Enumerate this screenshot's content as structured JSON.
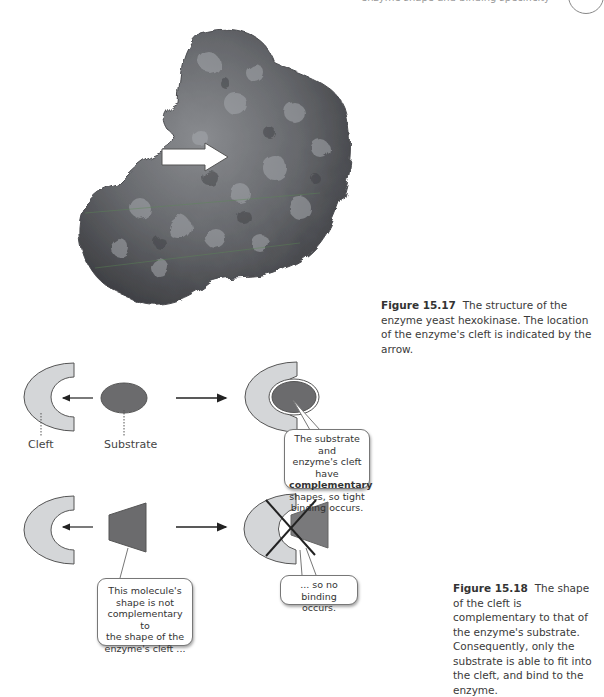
{
  "header": {
    "running_text": "enzyme shape and binding specificity"
  },
  "figure_15_17": {
    "label": "Figure 15.17",
    "caption": "The structure of the enzyme yeast hexokinase. The location of the enzyme's cleft is indicated by the arrow.",
    "image": "protein-surface-hexokinase",
    "arrow": "cleft-arrow"
  },
  "figure_15_18": {
    "label": "Figure 15.18",
    "caption": "The shape of the cleft is complementary to that of the enzyme's substrate. Consequently, only the substrate is able to fit into the cleft, and bind to the enzyme.",
    "labels": {
      "cleft": "Cleft",
      "substrate": "Substrate"
    },
    "bubble_bind": {
      "line1": "The substrate and",
      "line2": "enzyme's cleft have",
      "bold": "complementary",
      "line4": "shapes, so tight",
      "line5": "binding occurs."
    },
    "bubble_not": {
      "line1": "This molecule's",
      "line2": "shape is not",
      "line3": "complementary to",
      "line4": "the shape of the",
      "line5": "enzyme's cleft ..."
    },
    "bubble_no": {
      "line1": "... so no binding",
      "line2": "occurs."
    },
    "colors": {
      "enzyme_fill": "#d4d6d8",
      "substrate_fill": "#6b6b6d",
      "outline": "#555555"
    }
  }
}
